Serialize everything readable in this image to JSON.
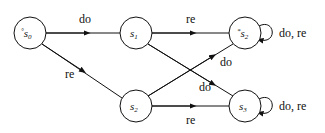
{
  "diagram": {
    "type": "state-transition-graph",
    "nodes": [
      {
        "id": "s0",
        "label": "s",
        "subscript": "0",
        "marker": "°",
        "cx": 30,
        "cy": 33,
        "r": 16
      },
      {
        "id": "s1",
        "label": "s",
        "subscript": "1",
        "marker": "",
        "cx": 136,
        "cy": 33,
        "r": 16
      },
      {
        "id": "s2top",
        "label": "s",
        "subscript": "2",
        "marker": "*",
        "cx": 245,
        "cy": 33,
        "r": 16
      },
      {
        "id": "s2",
        "label": "s",
        "subscript": "2",
        "marker": "",
        "cx": 136,
        "cy": 106,
        "r": 16
      },
      {
        "id": "s3",
        "label": "s",
        "subscript": "3",
        "marker": "",
        "cx": 245,
        "cy": 106,
        "r": 16
      }
    ],
    "edges": [
      {
        "from": "s0",
        "to": "s1",
        "label": "do"
      },
      {
        "from": "s0",
        "to": "s2",
        "label": "re"
      },
      {
        "from": "s1",
        "to": "s2top",
        "label": "re"
      },
      {
        "from": "s1",
        "to": "s3",
        "label": "do"
      },
      {
        "from": "s2",
        "to": "s2top",
        "label": "do"
      },
      {
        "from": "s2",
        "to": "s3",
        "label": "re"
      },
      {
        "from": "s2top",
        "to": "s2top",
        "label": "do, re"
      },
      {
        "from": "s3",
        "to": "s3",
        "label": "do, re"
      }
    ]
  },
  "labels": {
    "e_s0_s1": "do",
    "e_s0_s2": "re",
    "e_s1_s2top": "re",
    "e_s1_s3": "do",
    "e_s2_s2top": "do",
    "e_s2_s3": "re",
    "loop_s2top": "do, re",
    "loop_s3": "do, re",
    "n_s0_marker": "°",
    "n_s0": "s",
    "n_s0_sub": "0",
    "n_s1": "s",
    "n_s1_sub": "1",
    "n_s2top_marker": "*",
    "n_s2top": "s",
    "n_s2top_sub": "2",
    "n_s2": "s",
    "n_s2_sub": "2",
    "n_s3": "s",
    "n_s3_sub": "3"
  }
}
